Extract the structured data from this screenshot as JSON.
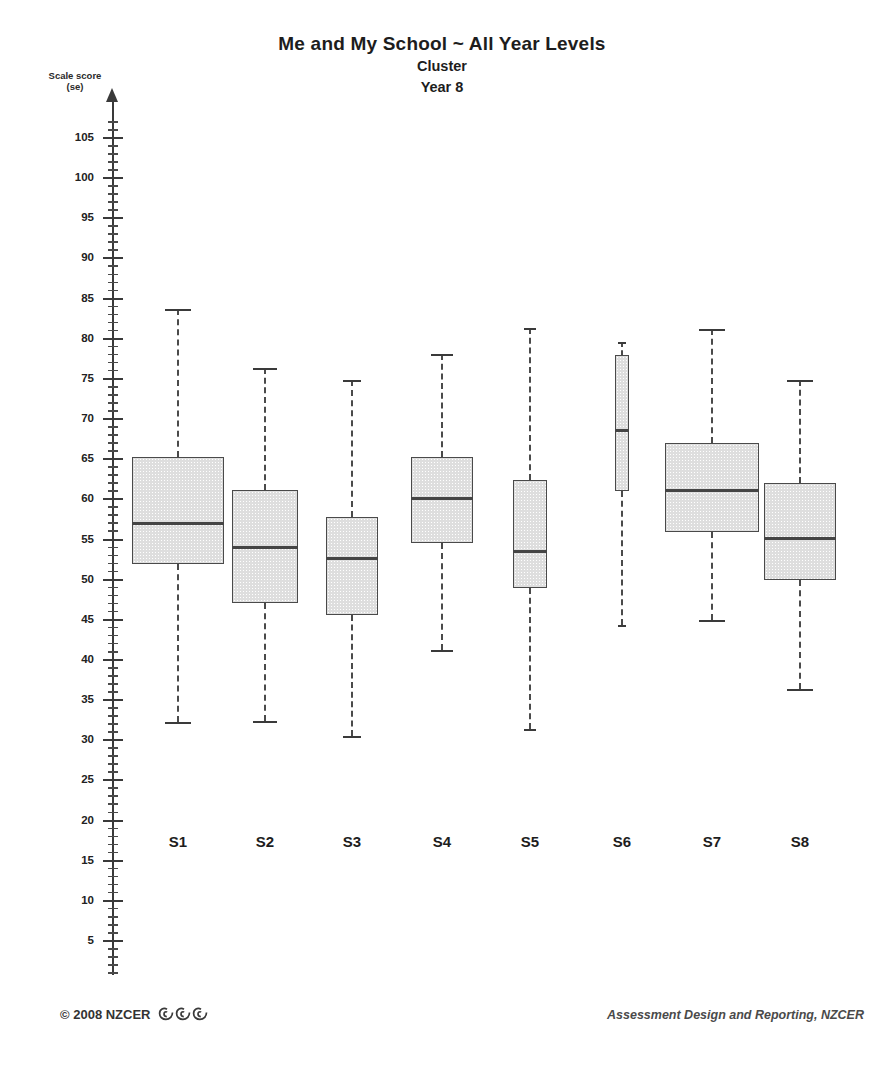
{
  "titles": {
    "main": "Me and My School ~ All Year Levels",
    "sub1": "Cluster",
    "sub2": "Year 8"
  },
  "axis": {
    "y_title_line1": "Scale score",
    "y_title_line2": "(se)"
  },
  "footer": {
    "copyright": "© 2008 NZCER",
    "logo_name": "koru-spiral-logo",
    "attribution": "Assessment Design and Reporting, NZCER"
  },
  "colors": {
    "box_fill": "#dedede",
    "box_border": "#4a4a4a",
    "median": "#454545",
    "axis": "#3a3a3a",
    "text": "#1d1d1d"
  },
  "chart_data": {
    "type": "box",
    "title": "Me and My School ~ All Year Levels",
    "subtitle": "Cluster / Year 8",
    "xlabel": "",
    "ylabel": "Scale score (se)",
    "ylim": [
      0,
      108
    ],
    "ytick_major": [
      5,
      10,
      15,
      20,
      25,
      30,
      35,
      40,
      45,
      50,
      55,
      60,
      65,
      70,
      75,
      80,
      85,
      90,
      95,
      100,
      105
    ],
    "ytick_minor_step": 1,
    "grid": false,
    "legend": "none",
    "categories": [
      "S1",
      "S2",
      "S3",
      "S4",
      "S5",
      "S6",
      "S7",
      "S8"
    ],
    "boxes": [
      {
        "label": "S1",
        "whisker_low": 32.3,
        "q1": 52.0,
        "median": 57.0,
        "q3": 65.3,
        "whisker_high": 83.7
      },
      {
        "label": "S2",
        "whisker_low": 32.4,
        "q1": 47.1,
        "median": 54.0,
        "q3": 61.2,
        "whisker_high": 76.4
      },
      {
        "label": "S3",
        "whisker_low": 30.5,
        "q1": 45.6,
        "median": 52.6,
        "q3": 57.8,
        "whisker_high": 74.9
      },
      {
        "label": "S4",
        "whisker_low": 41.2,
        "q1": 54.6,
        "median": 60.1,
        "q3": 65.3,
        "whisker_high": 78.1
      },
      {
        "label": "S5",
        "whisker_low": 31.4,
        "q1": 48.9,
        "median": 53.5,
        "q3": 62.4,
        "whisker_high": 81.3
      },
      {
        "label": "S6",
        "whisker_low": 44.4,
        "q1": 61.0,
        "median": 68.6,
        "q3": 78.0,
        "whisker_high": 79.6
      },
      {
        "label": "S7",
        "whisker_low": 45.0,
        "q1": 55.9,
        "median": 61.1,
        "q3": 67.0,
        "whisker_high": 81.2
      },
      {
        "label": "S8",
        "whisker_low": 36.4,
        "q1": 50.0,
        "median": 55.1,
        "q3": 62.0,
        "whisker_high": 74.9
      }
    ]
  }
}
